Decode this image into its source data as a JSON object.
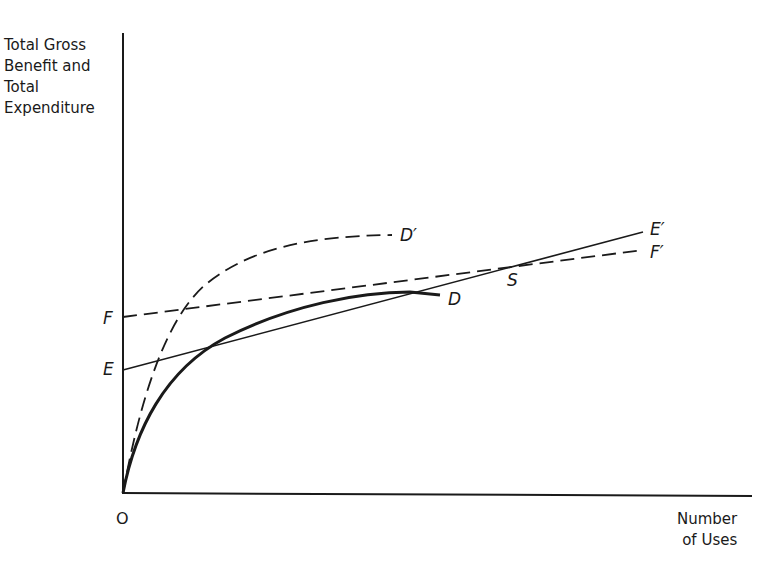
{
  "diagram": {
    "y_axis_label": [
      "Total Gross",
      "Benefit and",
      "Total",
      "Expenditure"
    ],
    "x_axis_label": [
      "Number",
      "of Uses"
    ],
    "origin_label": "O",
    "points": {
      "F": "F",
      "E": "E",
      "D": "D",
      "D_prime": "D′",
      "E_prime": "E′",
      "F_prime": "F′",
      "S": "S"
    },
    "curves": [
      {
        "id": "D",
        "style": "solid-thick",
        "description": "Total gross benefit curve, concave from O to D"
      },
      {
        "id": "D_prime",
        "style": "dashed",
        "description": "Shifted total gross benefit curve, concave from O to D'"
      },
      {
        "id": "EE_prime",
        "style": "solid-thin",
        "description": "Total expenditure line from E to E'"
      },
      {
        "id": "FF_prime",
        "style": "dashed",
        "description": "Total expenditure line from F to F'"
      }
    ],
    "colors": {
      "ink": "#1a1a1a",
      "background": "#ffffff"
    }
  }
}
